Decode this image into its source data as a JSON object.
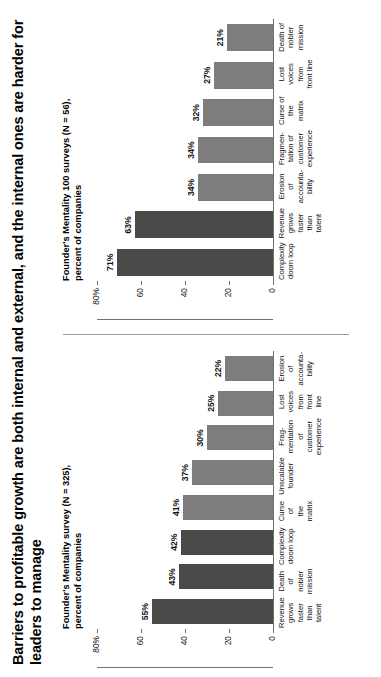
{
  "figure": {
    "title": "Barriers to profitable growth are both internal and external, and the internal ones are harder for leaders to manage"
  },
  "panels": {
    "left": {
      "subtitle": "Founder's Mentality survey (N = 325),\npercent of companies",
      "axis_labels": [
        "80%",
        "60",
        "40",
        "20",
        "0"
      ]
    },
    "right": {
      "subtitle": "Founder's Mentality 100 surveys (N = 56),\npercent of companies",
      "axis_labels": [
        "80%",
        "60",
        "40",
        "20",
        "0"
      ]
    }
  },
  "colors": {
    "dark_bar": "#4a4a4a",
    "light_bar": "#7d7d7d",
    "axis": "#6f6f6f",
    "text": "#111111"
  },
  "chart_data": [
    {
      "type": "bar",
      "title": "Founder's Mentality survey (N = 325), percent of companies",
      "xlabel": "",
      "ylabel": "percent of companies",
      "ylim": [
        0,
        80
      ],
      "yticks": [
        0,
        20,
        40,
        60,
        80
      ],
      "grid": false,
      "legend": "none",
      "orientation": "vertical",
      "categories": [
        "Revenue\ngrows\nfaster\nthan\ntalent",
        "Death\nof\nnobler\nmission",
        "Complexity\ndoom loop",
        "Curse\nof\nthe\nmatrix",
        "Unscalable\nfounder",
        "Frag-\nmentation\nof\ncustomer\nexperience",
        "Lost\nvoices\nfrom\nfront\nline",
        "Erosion\nof\naccounta-\nbility"
      ],
      "values": [
        55,
        43,
        42,
        41,
        37,
        30,
        25,
        22
      ],
      "value_labels": [
        "55%",
        "43%",
        "42%",
        "41%",
        "37%",
        "30%",
        "25%",
        "22%"
      ],
      "bar_shades": [
        "dark",
        "dark",
        "dark",
        "light",
        "light",
        "light",
        "light",
        "light"
      ]
    },
    {
      "type": "bar",
      "title": "Founder's Mentality 100 surveys (N = 56), percent of companies",
      "xlabel": "",
      "ylabel": "percent of companies",
      "ylim": [
        0,
        80
      ],
      "yticks": [
        0,
        20,
        40,
        60,
        80
      ],
      "grid": false,
      "legend": "none",
      "orientation": "vertical",
      "categories": [
        "Complexity\ndoom loop",
        "Revenue\ngrows\nfaster\nthan\ntalent",
        "Erosion\nof\naccounta-\nbility",
        "Fragmen-\ntation of\ncustomer\nexperience",
        "Curse of\nthe\nmatrix",
        "Lost\nvoices\nfrom\nfront line",
        "Death of\nnobler\nmission"
      ],
      "values": [
        71,
        63,
        34,
        34,
        32,
        27,
        21
      ],
      "value_labels": [
        "71%",
        "63%",
        "34%",
        "34%",
        "32%",
        "27%",
        "21%"
      ],
      "bar_shades": [
        "dark",
        "dark",
        "light",
        "light",
        "light",
        "light",
        "light"
      ]
    }
  ]
}
